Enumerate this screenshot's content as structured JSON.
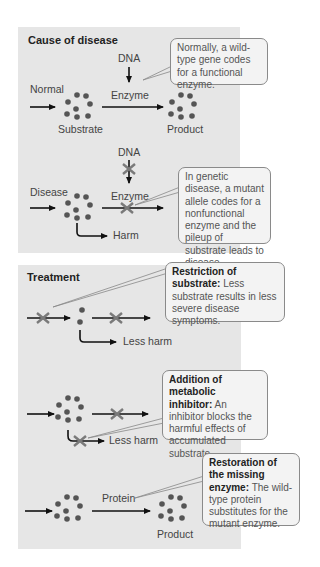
{
  "colors": {
    "panel_bg": "#e6e6e6",
    "dot": "#555555",
    "arrow": "#111111",
    "cross": "#7a7a7a",
    "callout_border": "#8a8a8a",
    "callout_bg": "#f3f3f3"
  },
  "cause": {
    "title": "Cause of disease",
    "normal": {
      "row_label": "Normal",
      "dna_label": "DNA",
      "enzyme_label": "Enzyme",
      "substrate_label": "Substrate",
      "product_label": "Product",
      "callout": "Normally, a wild-type gene codes for a functional enzyme."
    },
    "disease": {
      "row_label": "Disease",
      "dna_label": "DNA",
      "enzyme_label": "Enzyme",
      "harm_label": "Harm",
      "callout": "In genetic disease, a mutant allele codes for a nonfunctional enzyme and the pileup of substrate leads to disease."
    }
  },
  "treatment": {
    "title": "Treatment",
    "restriction": {
      "callout_title": "Restriction of substrate:",
      "callout_body": "Less substrate results in less severe disease symptoms.",
      "harm_label": "Less harm"
    },
    "inhibitor": {
      "callout_title": "Addition of metabolic inhibitor:",
      "callout_body": "An inhibitor blocks the harmful effects of accumulated substrate.",
      "harm_label": "Less harm"
    },
    "restoration": {
      "callout_title": "Restoration of the missing enzyme:",
      "callout_body": "The wild-type protein substitutes for the mutant enzyme.",
      "protein_label": "Protein",
      "product_label": "Product"
    }
  }
}
